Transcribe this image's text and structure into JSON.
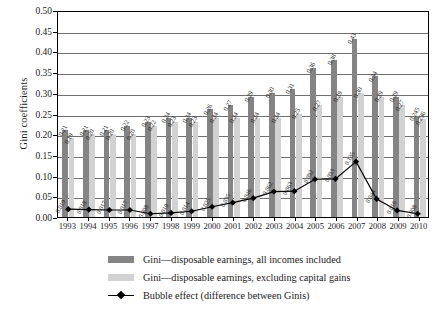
{
  "chart_data": {
    "type": "bar",
    "title": "",
    "xlabel": "",
    "ylabel": "Gini coefficients",
    "ylim": [
      0.0,
      0.5
    ],
    "ytick_step": 0.05,
    "grid": "horizontal",
    "legend_position": "bottom",
    "categories": [
      "1993",
      "1994",
      "1995",
      "1996",
      "1997",
      "1998",
      "1999",
      "2000",
      "2001",
      "2002",
      "2003",
      "2004",
      "2005",
      "2006",
      "2007",
      "2008",
      "2009",
      "2010"
    ],
    "yticks": [
      "0.00",
      "0.05",
      "0.10",
      "0.15",
      "0.20",
      "0.25",
      "0.30",
      "0.35",
      "0.40",
      "0.45",
      "0.50"
    ],
    "series": [
      {
        "name": "Gini—disposable earnings, all incomes included",
        "type": "bar",
        "color": "#848484",
        "values": [
          0.21,
          0.21,
          0.21,
          0.22,
          0.23,
          0.24,
          0.24,
          0.26,
          0.27,
          0.29,
          0.3,
          0.31,
          0.36,
          0.38,
          0.43,
          0.34,
          0.29,
          0.245
        ],
        "labels": [
          "0.21",
          "0.21",
          "0.21",
          "0.22",
          "0.23",
          "0.24",
          "0.24",
          "0.26",
          "0.27",
          "0.29",
          "0.30",
          "0.31",
          "0.36",
          "0.38",
          "0.43",
          "0.34",
          "0.29",
          "0.245"
        ]
      },
      {
        "name": "Gini—disposable earnings, excluding capital gains",
        "type": "bar",
        "color": "#d2d2d2",
        "values": [
          0.19,
          0.2,
          0.2,
          0.2,
          0.22,
          0.23,
          0.23,
          0.24,
          0.24,
          0.24,
          0.24,
          0.25,
          0.27,
          0.29,
          0.3,
          0.29,
          0.27,
          0.236
        ],
        "labels": [
          "0.19",
          "0.20",
          "0.20",
          "0.20",
          "0.22",
          "0.23",
          "0.23",
          "0.24",
          "0.24",
          "0.24",
          "0.24",
          "0.25",
          "0.27",
          "0.29",
          "0.30",
          "0.29",
          "0.27",
          "0.236"
        ]
      },
      {
        "name": "Bubble effect (difference between Ginis)",
        "type": "line",
        "color": "#000000",
        "marker": "diamond",
        "values": [
          0.019,
          0.018,
          0.017,
          0.017,
          0.008,
          0.01,
          0.014,
          0.025,
          0.035,
          0.046,
          0.062,
          0.063,
          0.092,
          0.093,
          0.135,
          0.044,
          0.016,
          0.008
        ],
        "labels": [
          "0.019",
          "0.018",
          "0.017",
          "0.017",
          "0.008",
          "0.010",
          "0.014",
          "0.025",
          "0.035",
          "0.046",
          "0.062",
          "0.063",
          "0.092",
          "0.093",
          "0.135",
          "0.044",
          "0.016",
          "0.008"
        ]
      }
    ]
  },
  "legend": {
    "items": [
      {
        "label": "Gini—disposable earnings, all incomes included",
        "swatch": "#848484",
        "kind": "bar"
      },
      {
        "label": "Gini—disposable earnings, excluding capital gains",
        "swatch": "#d2d2d2",
        "kind": "bar"
      },
      {
        "label": "Bubble effect (difference between Ginis)",
        "swatch": "#000000",
        "kind": "line"
      }
    ]
  }
}
